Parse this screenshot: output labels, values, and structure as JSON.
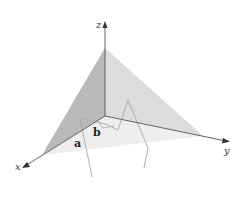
{
  "diagram": {
    "axes": {
      "x_label": "x",
      "y_label": "y",
      "z_label": "z"
    },
    "points": {
      "a_label": "a",
      "b_label": "b"
    },
    "colors": {
      "left_face": "#b9b9b9",
      "right_face": "#dcdcdc",
      "floor_face": "#ececec",
      "axis": "#555555",
      "curve": "#a8a8a8"
    }
  }
}
